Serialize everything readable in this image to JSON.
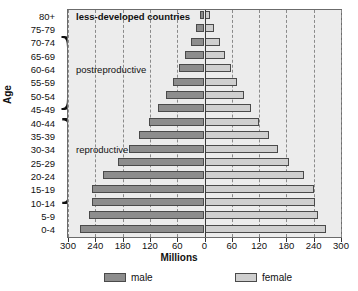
{
  "chart_data": {
    "type": "bar",
    "subtype": "population-pyramid",
    "title": "",
    "xlabel": "Millions",
    "ylabel": "Age",
    "categories": [
      "0-4",
      "5-9",
      "10-14",
      "15-19",
      "20-24",
      "25-29",
      "30-34",
      "35-39",
      "40-44",
      "45-49",
      "50-54",
      "55-59",
      "60-64",
      "65-69",
      "70-74",
      "75-79",
      "80+"
    ],
    "series": [
      {
        "name": "male",
        "side": "left",
        "color": "#8d8d8d",
        "values": [
          273,
          254,
          248,
          247,
          224,
          190,
          165,
          143,
          122,
          103,
          85,
          70,
          55,
          42,
          30,
          18,
          9
        ]
      },
      {
        "name": "female",
        "side": "right",
        "color": "#cfcfcf",
        "values": [
          268,
          249,
          243,
          241,
          219,
          186,
          162,
          141,
          120,
          102,
          86,
          72,
          58,
          45,
          33,
          21,
          12
        ]
      }
    ],
    "xlim": [
      -300,
      300
    ],
    "xticks": [
      -300,
      -240,
      -180,
      -120,
      -60,
      0,
      60,
      120,
      180,
      240,
      300
    ],
    "xtick_labels": [
      "300",
      "240",
      "180",
      "120",
      "60",
      "0",
      "60",
      "120",
      "180",
      "240",
      "300"
    ],
    "grid": true,
    "grid_axis": "x",
    "legend_position": "bottom",
    "annotations": [
      {
        "text": "less-developed countries",
        "at_category": "80+",
        "align": "left"
      },
      {
        "text": "postreproductive",
        "at_category": "60-64",
        "align": "left"
      },
      {
        "text": "reproductive",
        "at_category": "30-34",
        "align": "left"
      }
    ],
    "brace_groups": [
      {
        "label": "postreproductive",
        "from": "50-54",
        "to": "75-79"
      },
      {
        "label": "reproductive",
        "from": "15-19",
        "to": "45-49"
      }
    ]
  },
  "axes": {
    "y_title": "Age",
    "x_title": "Millions",
    "age_labels": [
      "80+",
      "75-79",
      "70-74",
      "65-69",
      "60-64",
      "55-59",
      "50-54",
      "45-49",
      "40-44",
      "35-39",
      "30-34",
      "25-29",
      "20-24",
      "15-19",
      "10-14",
      "5-9",
      "0-4"
    ],
    "x_labels": [
      "300",
      "240",
      "180",
      "120",
      "60",
      "0",
      "60",
      "120",
      "180",
      "240",
      "300"
    ]
  },
  "legend": {
    "items": [
      {
        "label": "male",
        "color": "#8d8d8d"
      },
      {
        "label": "female",
        "color": "#cfcfcf"
      }
    ]
  },
  "annotations": {
    "less_developed": "less-developed countries",
    "postreproductive": "postreproductive",
    "reproductive": "reproductive"
  },
  "colors": {
    "male": "#8d8d8d",
    "female": "#cfcfcf",
    "plot_bg": "#ececec",
    "grid": "#8a8a8a",
    "frame": "#6b6b6b"
  }
}
